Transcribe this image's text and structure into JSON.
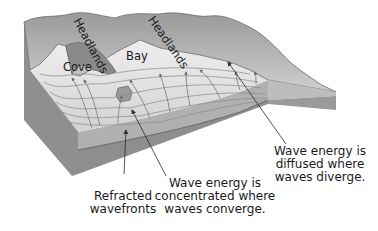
{
  "diagram": {
    "type": "block-diagram",
    "map_labels": {
      "headland_1": "Headlands",
      "headland_2": "Headlands",
      "cove": "Cove",
      "bay": "Bay"
    },
    "callouts": {
      "refracted": [
        "Refracted",
        "wavefronts"
      ],
      "concentrated": [
        "Wave energy is",
        "concentrated where",
        "waves converge."
      ],
      "diffused": [
        "Wave energy is",
        "diffused where",
        "waves diverge."
      ]
    },
    "colors": {
      "land_dark": "#8a8a8a",
      "land_light": "#c8c8c8",
      "water": "#dcdcdc",
      "wave_line": "#7a7a7a",
      "block_side_top": "#a9a9a9",
      "block_side_bottom": "#8e8e8e",
      "arrow": "#2b2b2b",
      "text": "#1a1a1a"
    }
  }
}
